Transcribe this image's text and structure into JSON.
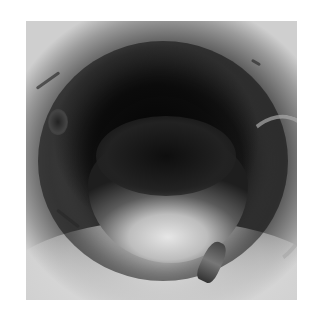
{
  "image": {
    "type": "photograph",
    "color_mode": "grayscale",
    "subject": "small animal (bat) curled inside a pale tube/pipe, viewed looking into the opening",
    "alt": "Grayscale photo of a bat tucked inside a tube"
  },
  "colors": {
    "background": "#ffffff",
    "tube_wall_light": "#d8d8d8",
    "tube_interior_dark": "#0a0a0a",
    "animal_belly": "#d0d0d0"
  }
}
